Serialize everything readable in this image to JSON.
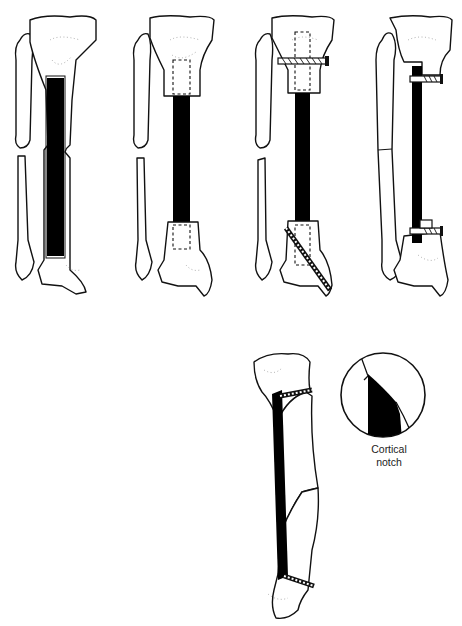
{
  "figure": {
    "panels": [
      {
        "id": "A",
        "name": "inlay-graft",
        "technique": "Graft laid in tibial trough spanning defect"
      },
      {
        "id": "B",
        "name": "intramedullary-peg-graft",
        "technique": "Graft ends pegged into medullary canal (dashed outline)"
      },
      {
        "id": "C",
        "name": "peg-graft-with-screws",
        "technique": "Pegged graft fixed with transverse proximal and oblique distal screws"
      },
      {
        "id": "D",
        "name": "onlay-graft-with-screws",
        "technique": "Graft onlaid along tibia, fixed with screws through notches"
      },
      {
        "id": "E",
        "name": "oblique-graft-cortical-notch",
        "technique": "Graft spanning bone, seated in cortical notches with screws"
      }
    ],
    "inset": {
      "caption_line1": "Cortical",
      "caption_line2": "notch"
    }
  },
  "colors": {
    "ink": "#111111",
    "graft": "#000000",
    "background": "#ffffff"
  }
}
